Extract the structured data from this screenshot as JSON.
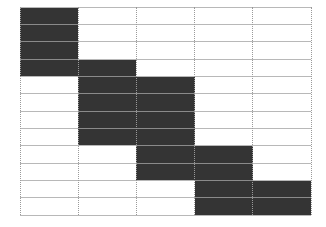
{
  "diagram": {
    "type": "staircase-grid",
    "columns": 5,
    "rows": 12,
    "colors": {
      "filled": "#343434",
      "empty": "#ffffff",
      "grid_line": "#b8b8b8",
      "grid_line_on_fill": "#8a8a8a",
      "vertical_line": "#9a9a9a"
    },
    "filled_ranges": [
      {
        "column": 1,
        "row_start": 1,
        "row_end": 4
      },
      {
        "column": 2,
        "row_start": 4,
        "row_end": 8
      },
      {
        "column": 3,
        "row_start": 5,
        "row_end": 10
      },
      {
        "column": 4,
        "row_start": 9,
        "row_end": 12
      },
      {
        "column": 5,
        "row_start": 11,
        "row_end": 12
      }
    ]
  }
}
